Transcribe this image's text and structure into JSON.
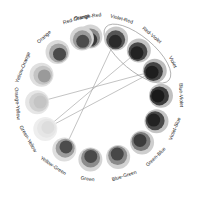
{
  "diagram": {
    "center": [
      99,
      98
    ],
    "node_radius": 62,
    "label_radius": 82,
    "nodes": [
      {
        "label": "Orange-Red",
        "angle": -98,
        "outer": "#d4d4d4",
        "mid": "#8a8a8a",
        "inner": "#3a3a3a"
      },
      {
        "label": "Violet-Red",
        "angle": -74,
        "outer": "#c8c8c8",
        "mid": "#555555",
        "inner": "#2a2a2a"
      },
      {
        "label": "Red-Violet",
        "angle": -50,
        "outer": "#c4c4c4",
        "mid": "#4a4a4a",
        "inner": "#232323"
      },
      {
        "label": "Violet",
        "angle": -26,
        "outer": "#bcbcbc",
        "mid": "#444444",
        "inner": "#1e1e1e"
      },
      {
        "label": "Blue-Violet",
        "angle": -2,
        "outer": "#c0c0c0",
        "mid": "#3c3c3c",
        "inner": "#1a1a1a"
      },
      {
        "label": "Violet-Blue",
        "angle": 22,
        "outer": "#c4c4c4",
        "mid": "#4a4a4a",
        "inner": "#222222"
      },
      {
        "label": "Green-Blue",
        "angle": 46,
        "outer": "#cecece",
        "mid": "#7a7a7a",
        "inner": "#3c3c3c"
      },
      {
        "label": "Blue-Green",
        "angle": 72,
        "outer": "#d2d2d2",
        "mid": "#8a8a8a",
        "inner": "#474747"
      },
      {
        "label": "Green",
        "angle": 98,
        "outer": "#d4d4d4",
        "mid": "#8c8c8c",
        "inner": "#4a4a4a"
      },
      {
        "label": "Yellow-Green",
        "angle": 124,
        "outer": "#dedede",
        "mid": "#9c9c9c",
        "inner": "#4c4c4c"
      },
      {
        "label": "Green-Yellow",
        "angle": 150,
        "outer": "#eeeeee",
        "mid": "#e6e6e6",
        "inner": "#dddddd"
      },
      {
        "label": "Orange-Yellow",
        "angle": 176,
        "outer": "#e6e6e6",
        "mid": "#d0d0d0",
        "inner": "#c4c4c4"
      },
      {
        "label": "Yellow-Orange",
        "angle": 202,
        "outer": "#e0e0e0",
        "mid": "#c4c4c4",
        "inner": "#9a9a9a"
      },
      {
        "label": "Orange",
        "angle": 228,
        "outer": "#dadada",
        "mid": "#a4a4a4",
        "inner": "#4a4a4a"
      },
      {
        "label": "Red-Orange",
        "angle": 254,
        "outer": "#d4d4d4",
        "mid": "#9a9a9a",
        "inner": "#4c4c4c"
      }
    ],
    "chords": [
      {
        "from": "Violet-Red",
        "to": "Yellow-Green"
      },
      {
        "from": "Red-Violet",
        "to": "Green-Yellow"
      },
      {
        "from": "Violet",
        "to": "Orange-Yellow"
      },
      {
        "from": "Violet",
        "to": "Green-Yellow"
      }
    ],
    "highlight": {
      "label": "Violet-Red to Violet group",
      "stroke": "#999999"
    }
  }
}
